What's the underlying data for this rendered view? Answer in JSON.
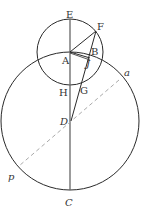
{
  "diagram": {
    "type": "geometric-construction",
    "colors": {
      "stroke": "#2a2a2a",
      "axis": "#555555",
      "dashed": "#aaaaaa",
      "label": "#333333"
    },
    "circles": [
      {
        "name": "small-circle",
        "center": "A"
      },
      {
        "name": "large-circle",
        "center": "D"
      }
    ],
    "labels": {
      "E": "E",
      "F": "F",
      "B": "B",
      "A": "A",
      "J": "J",
      "H": "H",
      "G": "G",
      "D": "D",
      "a": "a",
      "p": "p",
      "C": "C"
    }
  }
}
